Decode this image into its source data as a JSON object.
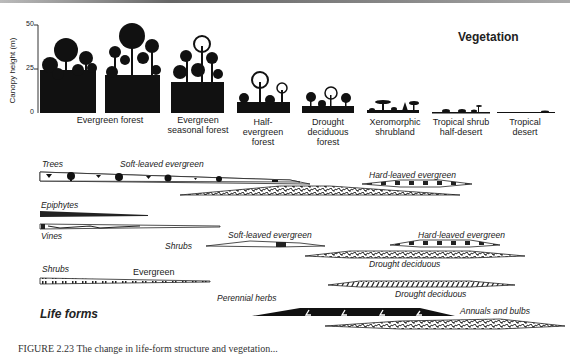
{
  "figure": {
    "vegetation_title": "Vegetation",
    "life_forms_title": "Life forms",
    "caption": "FIGURE 2.23  The change in life-form structure and vegetation...",
    "y_axis": {
      "label": "Canopy height (m)",
      "ticks": [
        "0",
        "25",
        "50"
      ]
    },
    "vegetation_types": [
      {
        "label": "Evergreen forest"
      },
      {
        "label": "Evergreen seasonal forest"
      },
      {
        "label": "Half-evergreen forest"
      },
      {
        "label": "Drought deciduous forest"
      },
      {
        "label": "Xeromorphic shrubland"
      },
      {
        "label": "Tropical shrub half-desert"
      },
      {
        "label": "Tropical desert"
      }
    ],
    "life_forms": {
      "trees": {
        "label": "Trees",
        "soft": "Soft-leaved evergreen",
        "hard": "Hard-leaved evergreen"
      },
      "epiphytes": {
        "label": "Epiphytes"
      },
      "vines": {
        "label": "Vines"
      },
      "shrubs_group": {
        "label": "Shrubs",
        "soft": "Soft-leaved evergreen",
        "hard": "Hard-leaved evergreen",
        "drought": "Drought deciduous"
      },
      "shrubs": {
        "label": "Shrubs",
        "evergreen": "Evergreen",
        "drought": "Drought deciduous"
      },
      "herbs": {
        "perennial": "Perennial herbs",
        "annuals": "Annuals and bulbs"
      }
    }
  }
}
